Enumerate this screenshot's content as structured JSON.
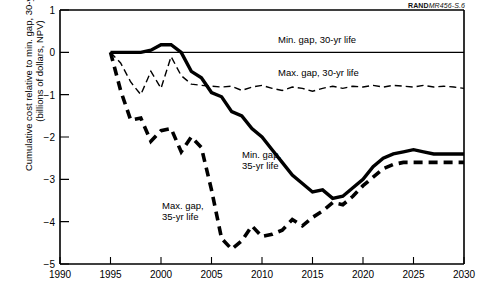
{
  "figure_id": {
    "bold": "RAND",
    "italic": "MR456-S.6"
  },
  "axes": {
    "ylabel_line1": "Cumulative cost relative to min. gap, 30-yr case",
    "ylabel_line2": "(billions of dollars, NPV)",
    "xlabel": "",
    "yticks": [
      "1",
      "0",
      "−1",
      "−2",
      "−3",
      "−4",
      "−5"
    ],
    "xticks": [
      "1990",
      "1995",
      "2000",
      "2005",
      "2010",
      "2015",
      "2020",
      "2025",
      "2030"
    ]
  },
  "series_labels": {
    "min30": "Min. gap, 30-yr life",
    "max30": "Max. gap, 30-yr life",
    "min35_l1": "Min. gap,",
    "min35_l2": "35-yr life",
    "max35_l1": "Max. gap,",
    "max35_l2": "35-yr life"
  },
  "chart_data": {
    "type": "line",
    "title": "",
    "xlabel": "",
    "ylabel": "Cumulative cost relative to min. gap, 30-yr case (billions of dollars, NPV)",
    "xlim": [
      1990,
      2030
    ],
    "ylim": [
      -5,
      1
    ],
    "xticks": [
      1990,
      1995,
      2000,
      2005,
      2010,
      2015,
      2020,
      2025,
      2030
    ],
    "yticks": [
      1,
      0,
      -1,
      -2,
      -3,
      -4,
      -5
    ],
    "grid": false,
    "legend": "inline-annotations",
    "series": [
      {
        "name": "Min. gap, 30-yr life",
        "style": "thin-solid",
        "x": [
          1995,
          2000,
          2005,
          2010,
          2015,
          2020,
          2025,
          2030
        ],
        "values": [
          0,
          0,
          0,
          0,
          0,
          0,
          0,
          0
        ]
      },
      {
        "name": "Max. gap, 30-yr life",
        "style": "thin-dashed",
        "x": [
          1995,
          1996,
          1997,
          1998,
          1999,
          2000,
          2001,
          2002,
          2003,
          2004,
          2005,
          2006,
          2007,
          2008,
          2009,
          2010,
          2011,
          2012,
          2013,
          2014,
          2015,
          2016,
          2017,
          2018,
          2019,
          2020,
          2021,
          2022,
          2023,
          2024,
          2025,
          2026,
          2027,
          2028,
          2029,
          2030
        ],
        "values": [
          0.0,
          -0.25,
          -0.7,
          -1.0,
          -0.45,
          -0.85,
          -0.1,
          -0.55,
          -0.75,
          -0.78,
          -0.8,
          -0.82,
          -0.8,
          -0.9,
          -0.82,
          -0.78,
          -0.85,
          -0.9,
          -0.82,
          -0.85,
          -0.92,
          -0.85,
          -0.8,
          -0.85,
          -0.8,
          -0.82,
          -0.78,
          -0.82,
          -0.78,
          -0.8,
          -0.82,
          -0.78,
          -0.82,
          -0.8,
          -0.82,
          -0.85
        ]
      },
      {
        "name": "Min. gap, 35-yr life",
        "style": "thick-solid",
        "x": [
          1995,
          1996,
          1997,
          1998,
          1999,
          2000,
          2001,
          2002,
          2003,
          2004,
          2005,
          2006,
          2007,
          2008,
          2009,
          2010,
          2011,
          2012,
          2013,
          2014,
          2015,
          2016,
          2017,
          2018,
          2019,
          2020,
          2021,
          2022,
          2023,
          2024,
          2025,
          2026,
          2027,
          2028,
          2029,
          2030
        ],
        "values": [
          0.0,
          0.0,
          0.0,
          0.0,
          0.05,
          0.18,
          0.18,
          0.0,
          -0.45,
          -0.6,
          -0.95,
          -1.05,
          -1.4,
          -1.5,
          -1.8,
          -2.0,
          -2.3,
          -2.6,
          -2.9,
          -3.1,
          -3.3,
          -3.25,
          -3.45,
          -3.4,
          -3.2,
          -3.0,
          -2.7,
          -2.5,
          -2.4,
          -2.35,
          -2.3,
          -2.35,
          -2.4,
          -2.4,
          -2.4,
          -2.4
        ]
      },
      {
        "name": "Max. gap, 35-yr life",
        "style": "thick-dashed",
        "x": [
          1995,
          1996,
          1997,
          1998,
          1999,
          2000,
          2001,
          2002,
          2003,
          2004,
          2005,
          2006,
          2007,
          2008,
          2009,
          2010,
          2011,
          2012,
          2013,
          2014,
          2015,
          2016,
          2017,
          2018,
          2019,
          2020,
          2021,
          2022,
          2023,
          2024,
          2025,
          2026,
          2027,
          2028,
          2029,
          2030
        ],
        "values": [
          0.0,
          -0.9,
          -1.6,
          -1.55,
          -2.1,
          -1.85,
          -1.8,
          -2.35,
          -2.0,
          -2.25,
          -3.25,
          -4.4,
          -4.65,
          -4.45,
          -4.1,
          -4.35,
          -4.3,
          -4.2,
          -3.95,
          -4.1,
          -3.9,
          -3.75,
          -3.55,
          -3.6,
          -3.4,
          -3.15,
          -2.95,
          -2.75,
          -2.65,
          -2.6,
          -2.6,
          -2.6,
          -2.6,
          -2.6,
          -2.6,
          -2.6
        ]
      }
    ]
  }
}
